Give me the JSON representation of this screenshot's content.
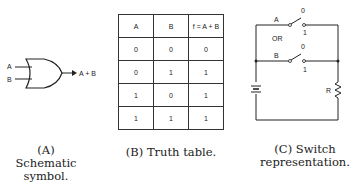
{
  "panel_a": {
    "inputs": [
      "A",
      "B"
    ],
    "output": "A + B",
    "caption_line1": "(A) Schematic",
    "caption_line2": "symbol."
  },
  "panel_b": {
    "headers": [
      "A",
      "B",
      "f = A + B"
    ],
    "rows": [
      [
        "0",
        "0",
        "0"
      ],
      [
        "0",
        "1",
        "1"
      ],
      [
        "1",
        "0",
        "1"
      ],
      [
        "1",
        "1",
        "1"
      ]
    ],
    "caption": "(B) Truth table."
  },
  "panel_c": {
    "switch_a_label": "A",
    "switch_b_label": "B",
    "or_label": "OR",
    "switch_a_off": "0",
    "switch_a_on": "1",
    "switch_b_off": "0",
    "switch_b_on": "1",
    "resistor_label": "R",
    "caption_line1": "(C) Switch",
    "caption_line2": "representation."
  }
}
